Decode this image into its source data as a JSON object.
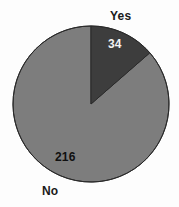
{
  "chart_data": {
    "type": "pie",
    "title": "",
    "subtitle": "",
    "xlabel": "",
    "ylabel": "",
    "legend_position": "none",
    "grid": false,
    "total": 250,
    "start_angle_deg": 0,
    "direction": "clockwise",
    "categories": [
      "Yes",
      "No"
    ],
    "values": [
      34,
      216
    ],
    "percentages": [
      13.6,
      86.4
    ],
    "slice_colors": [
      "#3d3d3d",
      "#7d7d7d"
    ],
    "slices": [
      {
        "label": "Yes",
        "value": 34,
        "value_text": "34",
        "percent": 13.6,
        "angle_deg": 49,
        "color": "#3d3d3d",
        "value_text_color": "#f2f2f2"
      },
      {
        "label": "No",
        "value": 216,
        "value_text": "216",
        "percent": 86.4,
        "angle_deg": 311,
        "color": "#7d7d7d",
        "value_text_color": "#101010"
      }
    ],
    "geometry": {
      "center_x": 91,
      "center_y": 104,
      "radius": 78
    }
  },
  "labels": {
    "yes_category": "Yes",
    "no_category": "No",
    "yes_value": "34",
    "no_value": "216"
  },
  "colors": {
    "background": "#fdfdfd",
    "slice_dark": "#3d3d3d",
    "slice_gray": "#7d7d7d",
    "outline": "#2a2a2a",
    "text_dark": "#1a1a1a",
    "text_light": "#f2f2f2"
  }
}
